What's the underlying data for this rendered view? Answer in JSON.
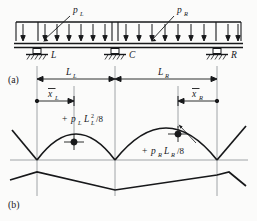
{
  "figure": {
    "title_hidden": "Two-span continuous beam with uniform loads and bending moment diagram",
    "part_labels": {
      "top": "(a)",
      "bottom": "(b)"
    },
    "loads": [
      {
        "name": "left-udl",
        "label": "p",
        "subscript": "L"
      },
      {
        "name": "right-udl",
        "label": "p",
        "subscript": "R"
      }
    ],
    "supports": [
      {
        "name": "left-support",
        "label": "L"
      },
      {
        "name": "center-support",
        "label": "C"
      },
      {
        "name": "right-support",
        "label": "R"
      }
    ],
    "span_dimensions": [
      {
        "name": "left-span",
        "label": "L",
        "subscript": "L"
      },
      {
        "name": "right-span",
        "label": "L",
        "subscript": "R"
      }
    ],
    "centroid_dimensions": [
      {
        "name": "left-centroid",
        "label": "x",
        "subscript": "L",
        "overbar": true
      },
      {
        "name": "right-centroid",
        "label": "x",
        "subscript": "R",
        "overbar": true
      }
    ],
    "moment_annotations": [
      {
        "name": "left-moment",
        "sign": "+",
        "base": "p",
        "base_sub": "L",
        "term": "L",
        "term_sub": "L",
        "term_sup": "2",
        "divisor": "/8",
        "full_text": "+ p_L L_L^2 /8"
      },
      {
        "name": "right-moment",
        "sign": "+",
        "base": "p",
        "base_sub": "R",
        "term": "L",
        "term_sub": "R",
        "term_sup": "",
        "divisor": "/8",
        "full_text": "+ p_R L_R /8"
      }
    ],
    "colors": {
      "ink": "#17181a",
      "guide": "#8c8f92",
      "paper": "#fbfbfa"
    }
  }
}
